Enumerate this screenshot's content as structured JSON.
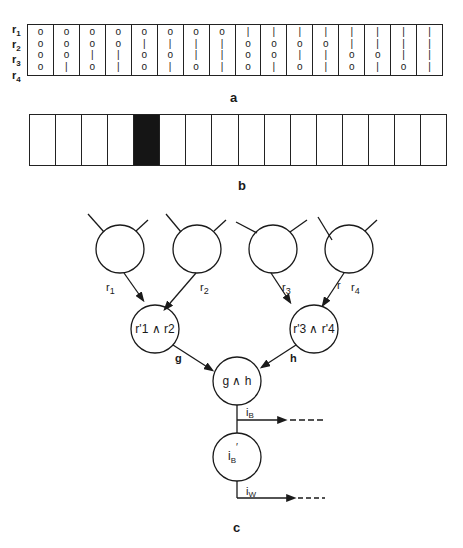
{
  "panel_a": {
    "caption": "a",
    "row_labels": [
      {
        "base": "r",
        "sub": "1"
      },
      {
        "base": "r",
        "sub": "2"
      },
      {
        "base": "r",
        "sub": "3"
      },
      {
        "base": "r",
        "sub": "4"
      }
    ],
    "columns": [
      [
        "0",
        "0",
        "0",
        "0"
      ],
      [
        "0",
        "0",
        "0",
        "1"
      ],
      [
        "0",
        "0",
        "1",
        "0"
      ],
      [
        "0",
        "0",
        "1",
        "1"
      ],
      [
        "0",
        "1",
        "0",
        "0"
      ],
      [
        "0",
        "1",
        "0",
        "1"
      ],
      [
        "0",
        "1",
        "1",
        "0"
      ],
      [
        "0",
        "1",
        "1",
        "1"
      ],
      [
        "1",
        "0",
        "0",
        "0"
      ],
      [
        "1",
        "0",
        "0",
        "1"
      ],
      [
        "1",
        "0",
        "1",
        "0"
      ],
      [
        "1",
        "0",
        "1",
        "1"
      ],
      [
        "1",
        "1",
        "0",
        "0"
      ],
      [
        "1",
        "1",
        "0",
        "1"
      ],
      [
        "1",
        "1",
        "1",
        "0"
      ],
      [
        "1",
        "1",
        "1",
        "1"
      ]
    ]
  },
  "panel_b": {
    "caption": "b",
    "cell_count": 16,
    "filled_index": 4,
    "fill_color": "#151515"
  },
  "panel_c": {
    "caption": "c",
    "input_labels": [
      "r1",
      "r2",
      "r3",
      "r4"
    ],
    "node_left": "r'1 ∧ r2",
    "node_right": "r'3 ∧ r'4",
    "edge_left": "g",
    "edge_right": "h",
    "node_root": "g ∧ h",
    "output_top": "iB",
    "node_inverter": "i'B",
    "output_bottom": "iW"
  }
}
